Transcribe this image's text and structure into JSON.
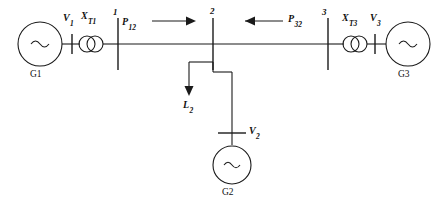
{
  "diagram": {
    "type": "single-line-diagram",
    "background_color": "#ffffff",
    "line_color": "#1a1a1a"
  },
  "generators": [
    {
      "id": "g1",
      "name": "G1",
      "symbol": "~",
      "position": "left"
    },
    {
      "id": "g2",
      "name": "G2",
      "symbol": "~",
      "position": "bottom-center"
    },
    {
      "id": "g3",
      "name": "G3",
      "symbol": "~",
      "position": "right"
    }
  ],
  "voltages": [
    {
      "id": "v1",
      "base": "V",
      "sub": "1",
      "text": "V1"
    },
    {
      "id": "v2",
      "base": "V",
      "sub": "2",
      "text": "V2"
    },
    {
      "id": "v3",
      "base": "V",
      "sub": "3",
      "text": "V3"
    }
  ],
  "transformers": [
    {
      "id": "xt1",
      "base": "X",
      "sub": "T1",
      "text": "XT1",
      "symbol": "two-circle-transformer"
    },
    {
      "id": "xt3",
      "base": "X",
      "sub": "T3",
      "text": "XT3",
      "symbol": "two-circle-transformer"
    }
  ],
  "buses": [
    {
      "id": "bus1",
      "label": "1"
    },
    {
      "id": "bus2",
      "label": "2"
    },
    {
      "id": "bus3",
      "label": "3"
    }
  ],
  "power_flows": [
    {
      "id": "p12",
      "base": "P",
      "sub": "12",
      "text": "P12",
      "direction": "right",
      "arrow": "→"
    },
    {
      "id": "p32",
      "base": "P",
      "sub": "32",
      "text": "P32",
      "direction": "left",
      "arrow": "←"
    }
  ],
  "loads": [
    {
      "id": "l2",
      "base": "L",
      "sub": "2",
      "text": "L2",
      "direction": "down",
      "arrow": "↓"
    }
  ]
}
